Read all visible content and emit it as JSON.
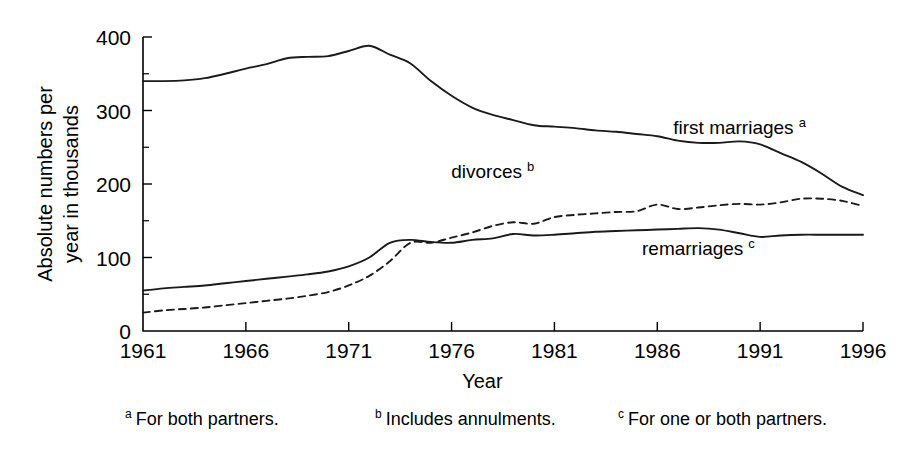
{
  "chart_data": {
    "type": "line",
    "title": "",
    "subtitle": "",
    "xlabel": "Year",
    "ylabel": "Absolute numbers per year in thousands",
    "ylabel_line1": "Absolute numbers per",
    "ylabel_line2": "year in thousands",
    "grid": false,
    "legend_position": "inline-annotations",
    "xlim": [
      1961,
      1996
    ],
    "ylim": [
      0,
      400
    ],
    "x_ticks": [
      1961,
      1966,
      1971,
      1976,
      1981,
      1986,
      1991,
      1996
    ],
    "x_tick_labels": [
      "1961",
      "1966",
      "1971",
      "1976",
      "1981",
      "1986",
      "1991",
      "1996"
    ],
    "y_ticks": [
      0,
      100,
      200,
      300,
      400
    ],
    "y_tick_labels": [
      "0",
      "100",
      "200",
      "300",
      "400"
    ],
    "y_minor_ticks": [
      50,
      150,
      250,
      350
    ],
    "x": [
      1961,
      1962,
      1963,
      1964,
      1965,
      1966,
      1967,
      1968,
      1969,
      1970,
      1971,
      1972,
      1973,
      1974,
      1975,
      1976,
      1977,
      1978,
      1979,
      1980,
      1981,
      1982,
      1983,
      1984,
      1985,
      1986,
      1987,
      1988,
      1989,
      1990,
      1991,
      1992,
      1993,
      1994,
      1995,
      1996
    ],
    "series": [
      {
        "name": "first marriages",
        "footnote_marker": "a",
        "style": "solid",
        "label_x": 1990,
        "label_y": 268,
        "values": [
          340,
          340,
          341,
          344,
          350,
          357,
          363,
          371,
          373,
          374,
          381,
          388,
          376,
          364,
          340,
          320,
          304,
          294,
          287,
          280,
          278,
          276,
          273,
          271,
          268,
          265,
          259,
          256,
          256,
          258,
          254,
          242,
          230,
          214,
          196,
          185
        ]
      },
      {
        "name": "divorces",
        "footnote_marker": "b",
        "style": "dashed",
        "label_x": 1978,
        "label_y": 208,
        "values": [
          25,
          28,
          30,
          32,
          35,
          38,
          41,
          44,
          48,
          53,
          62,
          75,
          95,
          120,
          120,
          127,
          134,
          143,
          148,
          146,
          155,
          158,
          160,
          162,
          163,
          172,
          166,
          168,
          171,
          173,
          172,
          175,
          180,
          180,
          177,
          170
        ]
      },
      {
        "name": "remarriages",
        "footnote_marker": "c",
        "style": "solid",
        "label_x": 1988,
        "label_y": 104,
        "values": [
          55,
          58,
          60,
          62,
          65,
          68,
          71,
          74,
          77,
          81,
          88,
          100,
          120,
          124,
          121,
          120,
          124,
          126,
          132,
          130,
          131,
          133,
          135,
          136,
          137,
          138,
          139,
          140,
          138,
          133,
          128,
          130,
          131,
          131,
          131,
          131
        ]
      }
    ],
    "footnotes": [
      {
        "marker": "a",
        "text": "For both partners."
      },
      {
        "marker": "b",
        "text": "Includes annulments."
      },
      {
        "marker": "c",
        "text": "For one or both partners."
      }
    ],
    "colors": {
      "line": "#1a1a1a",
      "axis": "#000000",
      "background": "#ffffff",
      "text": "#000000"
    }
  }
}
